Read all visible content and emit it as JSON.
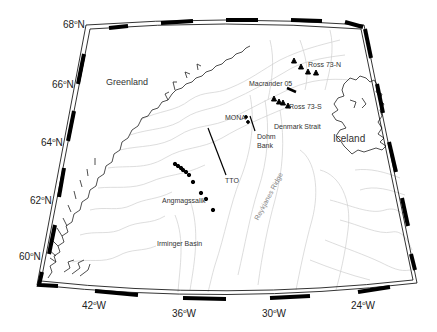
{
  "map": {
    "region": "Irminger Sea / Denmark Strait",
    "frame": {
      "corners": {
        "top_left": [
          86,
          25
        ],
        "top_right": [
          364,
          25
        ],
        "bottom_right": [
          417,
          283
        ],
        "bottom_left": [
          37,
          285
        ]
      },
      "latitude_ticks": [
        {
          "deg": "68",
          "hemi": "N",
          "label": "68°N"
        },
        {
          "deg": "66",
          "hemi": "N",
          "label": "66°N"
        },
        {
          "deg": "64",
          "hemi": "N",
          "label": "64°N"
        },
        {
          "deg": "62",
          "hemi": "N",
          "label": "62°N"
        },
        {
          "deg": "60",
          "hemi": "N",
          "label": "60°N"
        }
      ],
      "longitude_ticks": [
        {
          "deg": "42",
          "hemi": "W",
          "label": "42°W"
        },
        {
          "deg": "36",
          "hemi": "W",
          "label": "36°W"
        },
        {
          "deg": "30",
          "hemi": "W",
          "label": "30°W"
        },
        {
          "deg": "24",
          "hemi": "W",
          "label": "24°W"
        }
      ]
    },
    "land_labels": {
      "greenland": "Greenland",
      "iceland": "Iceland"
    },
    "feature_labels": {
      "denmark_strait": "Denmark Strait",
      "dohm_bank_1": "Dohm",
      "dohm_bank_2": "Bank",
      "irminger_basin": "Irminger Basin",
      "reykjanes_ridge": "Reykjanes Ridge"
    },
    "station_labels": {
      "ross_73_n": "Ross 73-N",
      "ross_73_s": "Ross 73-S",
      "macrander_05": "Macrander 05",
      "mona": "MONA",
      "tto": "TTO",
      "angmagssalik": "Angmagssalik"
    },
    "colors": {
      "frame": "#000000",
      "coastline": "#222222",
      "bathymetry": "#c8c8c8",
      "markers": "#000000",
      "text": "#333333"
    }
  }
}
